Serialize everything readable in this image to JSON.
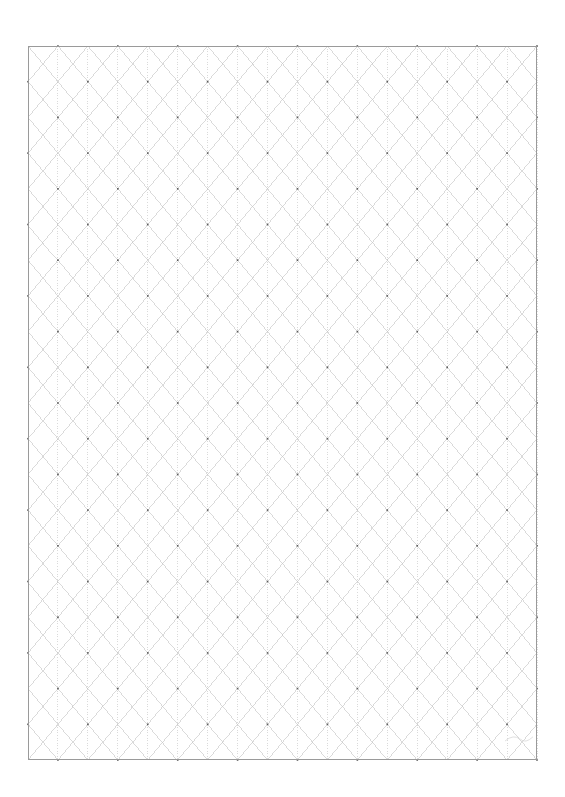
{
  "document": {
    "kind": "isometric-grid-paper",
    "title": "Isometric Grid Paper",
    "page_width": 565,
    "page_height": 797,
    "background_color": "#ffffff",
    "orientation": "portrait"
  },
  "grid": {
    "label": "isometric-triangle-grid",
    "origin_x": 28,
    "origin_y": 46,
    "width": 509,
    "height": 714,
    "columns": 17,
    "rows": 20,
    "column_width": 29.94,
    "row_height": 35.7,
    "line_color": "#c2c2c2",
    "node_color": "#5a5a5a",
    "border_color": "#9a9a9a",
    "border_width": 1.0,
    "line_width": 0.6,
    "diagonal_style": "solid-faint",
    "vertical_style": "dotted-faint",
    "node_size": 1.6,
    "node_spacing_x": 59.88,
    "node_spacing_y": 35.7
  },
  "marks": {
    "signature": {
      "label": "faint-pencil-mark",
      "x": 505,
      "y": 735,
      "width": 28,
      "height": 6,
      "color": "#d8d8d8"
    }
  },
  "legend": {
    "note": ""
  }
}
